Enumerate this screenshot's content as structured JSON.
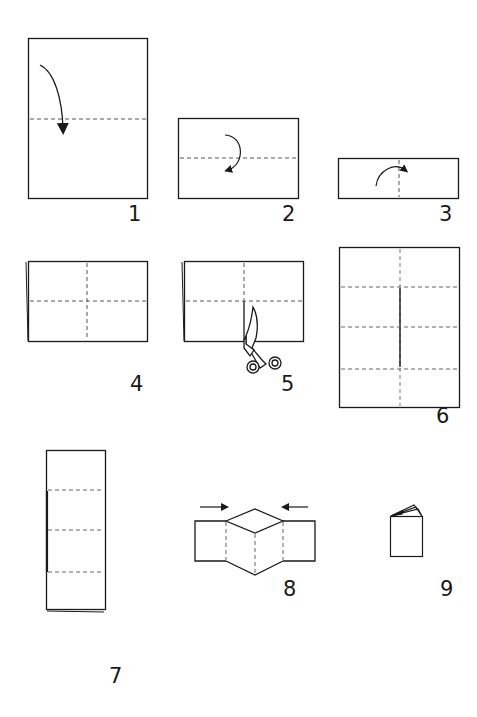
{
  "diagram": {
    "stroke_color": "#1a1a1a",
    "dash_color": "#555555",
    "steps": [
      {
        "number": "1",
        "action": "Fold top half down along horizontal center",
        "icon": "fold-arrow-icon"
      },
      {
        "number": "2",
        "action": "Fold in half again horizontally",
        "icon": "fold-arrow-icon"
      },
      {
        "number": "3",
        "action": "Fold in half along vertical center",
        "icon": "fold-arrow-icon"
      },
      {
        "number": "4",
        "action": "Unfold to show crease lines",
        "icon": "crease-lines"
      },
      {
        "number": "5",
        "action": "Cut along center crease of folded edge",
        "icon": "scissors-icon"
      },
      {
        "number": "6",
        "action": "Open sheet showing center slit",
        "icon": "slit-line"
      },
      {
        "number": "7",
        "action": "Fold in half lengthwise",
        "icon": "folded-strip"
      },
      {
        "number": "8",
        "action": "Push ends toward center",
        "icon": "push-arrows-icon"
      },
      {
        "number": "9",
        "action": "Fold into finished booklet",
        "icon": "book-icon"
      }
    ]
  }
}
